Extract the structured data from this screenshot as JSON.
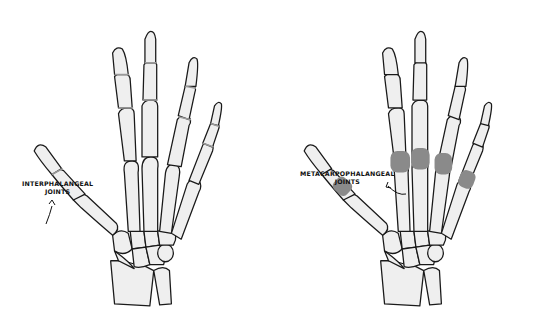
{
  "figure": {
    "colors": {
      "background": "#ffffff",
      "bone_fill": "#efefef",
      "outline": "#1a1a1a",
      "highlighted_joint": "#8a8a8a",
      "interphalangeal_line": "#9a9a9a"
    },
    "left_panel": {
      "title": "hand-skeleton-interphalangeal",
      "label_line1": "INTERPHALANGEAL",
      "label_line2": "JOINTS"
    },
    "right_panel": {
      "title": "hand-skeleton-metacarpophalangeal",
      "label_line1": "METACARPOPHALANGEAL",
      "label_line2": "JOINTS"
    }
  }
}
